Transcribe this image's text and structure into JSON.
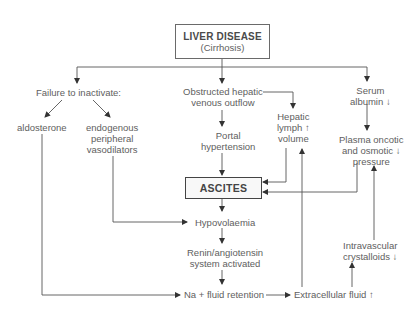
{
  "diagram": {
    "root": {
      "title": "LIVER DISEASE",
      "subtitle": "(Cirrhosis)"
    },
    "nodes": {
      "failure": "Failure to inactivate:",
      "aldosterone": "aldosterone",
      "vasodilators": [
        "endogenous",
        "peripheral",
        "vasodilators"
      ],
      "obstructed": [
        "Obstructed hepatic",
        "venous outflow"
      ],
      "portal": [
        "Portal",
        "hypertension"
      ],
      "lymph": [
        "Hepatic",
        "lymph ↑",
        "volume"
      ],
      "albumin": [
        "Serum",
        "albumin ↓"
      ],
      "plasma": [
        "Plasma oncotic",
        "and osmotic ↓",
        "pressure"
      ],
      "ascites": "ASCITES",
      "hypovolaemia": "Hypovolaemia",
      "renin": [
        "Renin/angiotensin",
        "system activated"
      ],
      "sodium": "Na + fluid retention",
      "ecf": "Extracellular fluid ↑",
      "crystalloids": [
        "Intravascular",
        "crystalloids ↓"
      ]
    },
    "edges": [
      [
        "root",
        "failure"
      ],
      [
        "root",
        "obstructed"
      ],
      [
        "root",
        "albumin"
      ],
      [
        "failure",
        "aldosterone"
      ],
      [
        "failure",
        "vasodilators"
      ],
      [
        "obstructed",
        "portal"
      ],
      [
        "obstructed",
        "lymph"
      ],
      [
        "portal",
        "ascites"
      ],
      [
        "lymph",
        "ascites"
      ],
      [
        "plasma",
        "ascites"
      ],
      [
        "albumin",
        "plasma"
      ],
      [
        "ascites",
        "hypovolaemia"
      ],
      [
        "vasodilators",
        "hypovolaemia"
      ],
      [
        "hypovolaemia",
        "renin"
      ],
      [
        "renin",
        "sodium"
      ],
      [
        "aldosterone",
        "sodium"
      ],
      [
        "sodium",
        "ecf"
      ],
      [
        "ecf",
        "lymph"
      ],
      [
        "ecf",
        "crystalloids"
      ],
      [
        "crystalloids",
        "plasma"
      ]
    ]
  }
}
